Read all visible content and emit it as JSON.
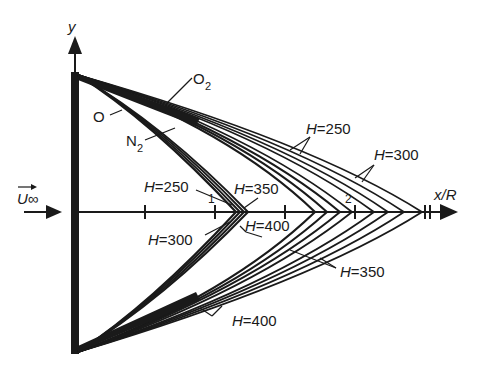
{
  "figure": {
    "type": "shock-wave-diagram",
    "axes": {
      "x_label": "x/R",
      "y_label": "y",
      "x_ticks": [
        {
          "pos": 145,
          "label": ""
        },
        {
          "pos": 215,
          "label": "1"
        },
        {
          "pos": 285,
          "label": ""
        },
        {
          "pos": 355,
          "label": "2"
        }
      ]
    },
    "freestream_label": "U∞",
    "species_labels": {
      "o2": "O",
      "o2_sub": "2",
      "o": "O",
      "n2": "N",
      "n2_sub": "2"
    },
    "h_labels": {
      "inner_250": "H=250",
      "inner_300": "H=300",
      "inner_350": "H=350",
      "inner_400": "H=400",
      "outer_250": "H=250",
      "outer_300": "H=300",
      "outer_350": "H=350",
      "outer_400": "H=400"
    },
    "colors": {
      "ink": "#1a1a1a",
      "background": "#ffffff"
    }
  }
}
